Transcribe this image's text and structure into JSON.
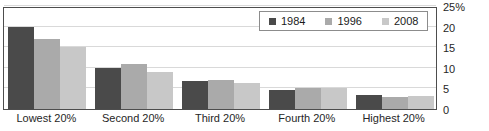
{
  "chart_data": {
    "type": "bar",
    "title": "",
    "xlabel": "",
    "ylabel": "",
    "ylim": [
      0,
      25
    ],
    "yticks": [
      0,
      5,
      10,
      15,
      20,
      25
    ],
    "ytick_labels": [
      "0",
      "5",
      "10",
      "15",
      "20",
      "25%"
    ],
    "grid": true,
    "legend_position": "top-right",
    "categories": [
      "Lowest 20%",
      "Second 20%",
      "Third 20%",
      "Fourth 20%",
      "Highest 20%"
    ],
    "series": [
      {
        "name": "1984",
        "color": "#4a4a4a",
        "values": [
          20.0,
          10.0,
          6.7,
          4.5,
          3.3
        ]
      },
      {
        "name": "1996",
        "color": "#aaaaaa",
        "values": [
          17.0,
          11.0,
          7.0,
          5.0,
          3.0
        ]
      },
      {
        "name": "2008",
        "color": "#c8c8c8",
        "values": [
          15.0,
          9.0,
          6.3,
          5.0,
          3.2
        ]
      }
    ]
  },
  "legend": {
    "items": [
      {
        "label": "1984"
      },
      {
        "label": "1996"
      },
      {
        "label": "2008"
      }
    ]
  },
  "axis": {
    "y_tick_labels": [
      "25%",
      "20",
      "15",
      "10",
      "5",
      "0"
    ],
    "x_tick_labels": [
      "Lowest 20%",
      "Second 20%",
      "Third 20%",
      "Fourth 20%",
      "Highest 20%"
    ]
  },
  "title_sliver": ""
}
